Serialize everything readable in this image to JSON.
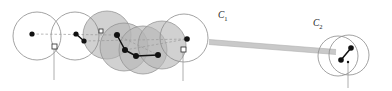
{
  "figure": {
    "background_color": "#ffffff",
    "width": 392,
    "height": 91,
    "labels": [
      {
        "name": "cluster-label-c1",
        "base": "C",
        "subscript": "1",
        "x": 218,
        "y": 18
      },
      {
        "name": "cluster-label-c2",
        "base": "C",
        "subscript": "2",
        "x": 313,
        "y": 26
      }
    ],
    "colors": {
      "circle_stroke": "#8c8c8c",
      "circle_fill_shaded": "#b4b4b4",
      "circle_fill_plain": "#ffffff",
      "point_fill": "#111111",
      "segment_stroke": "#111111",
      "dashed_stroke": "#9a9a9a",
      "bar_fill": "#c9c9c9",
      "bar_stroke": "#b0b0b0",
      "marker_fill": "#ffffff",
      "marker_stroke": "#2b2b2b",
      "tick_stroke": "#9a9a9a",
      "label_fill": "#1a1a1a"
    },
    "circles_plain": [
      {
        "name": "disk-c1-a",
        "cx": 37,
        "cy": 36,
        "r": 24
      },
      {
        "name": "disk-c1-b",
        "cx": 75,
        "cy": 36,
        "r": 24
      },
      {
        "name": "disk-c1-g",
        "cx": 184,
        "cy": 38,
        "r": 24
      }
    ],
    "circles_shaded": [
      {
        "name": "disk-c1-c",
        "cx": 107,
        "cy": 35,
        "r": 24
      },
      {
        "name": "disk-c1-d",
        "cx": 124,
        "cy": 47,
        "r": 24
      },
      {
        "name": "disk-c1-e",
        "cx": 143,
        "cy": 50,
        "r": 24
      },
      {
        "name": "disk-c1-f",
        "cx": 162,
        "cy": 45,
        "r": 24
      }
    ],
    "circles_c2": [
      {
        "name": "disk-c2-a",
        "cx": 349,
        "cy": 55,
        "r": 20
      },
      {
        "name": "disk-c2-b",
        "cx": 338,
        "cy": 56,
        "r": 20
      }
    ],
    "points": [
      {
        "name": "point-p1",
        "cx": 32,
        "cy": 34,
        "r": 2.6
      },
      {
        "name": "point-p2",
        "cx": 76,
        "cy": 34,
        "r": 2.6
      },
      {
        "name": "point-p3",
        "cx": 84,
        "cy": 41,
        "r": 2.6
      },
      {
        "name": "point-p4",
        "cx": 117,
        "cy": 35,
        "r": 3.0
      },
      {
        "name": "point-p5",
        "cx": 125,
        "cy": 50,
        "r": 3.0
      },
      {
        "name": "point-p6",
        "cx": 136,
        "cy": 56,
        "r": 3.0
      },
      {
        "name": "point-p7",
        "cx": 158,
        "cy": 55,
        "r": 3.0
      },
      {
        "name": "point-p8",
        "cx": 187,
        "cy": 39,
        "r": 2.8
      },
      {
        "name": "point-c2a",
        "cx": 351,
        "cy": 48,
        "r": 2.8
      },
      {
        "name": "point-c2b",
        "cx": 341,
        "cy": 60,
        "r": 2.8
      },
      {
        "name": "point-tiny",
        "cx": 348,
        "cy": 62,
        "r": 1.2
      },
      {
        "name": "point-tiny-left",
        "cx": 56,
        "cy": 48,
        "r": 1.2
      }
    ],
    "segments": [
      {
        "name": "segment-s1",
        "x1": 76,
        "y1": 34,
        "x2": 84,
        "y2": 41
      },
      {
        "name": "segment-s2",
        "x1": 117,
        "y1": 35,
        "x2": 125,
        "y2": 50
      },
      {
        "name": "segment-s3",
        "x1": 125,
        "y1": 50,
        "x2": 136,
        "y2": 56
      },
      {
        "name": "segment-s4",
        "x1": 136,
        "y1": 56,
        "x2": 158,
        "y2": 55
      },
      {
        "name": "segment-c2",
        "x1": 351,
        "y1": 48,
        "x2": 341,
        "y2": 60
      }
    ],
    "dashed_paths": [
      {
        "name": "dashed-d1",
        "x1": 32,
        "y1": 34,
        "x2": 117,
        "y2": 35
      },
      {
        "name": "dashed-d2",
        "x1": 84,
        "y1": 41,
        "x2": 187,
        "y2": 39
      },
      {
        "name": "dashed-d3",
        "x1": 117,
        "y1": 35,
        "x2": 158,
        "y2": 55
      },
      {
        "name": "dashed-d4",
        "x1": 125,
        "y1": 50,
        "x2": 187,
        "y2": 39
      }
    ],
    "bar": {
      "name": "connecting-bar",
      "x1": 209,
      "y1": 42,
      "x2": 336,
      "y2": 52,
      "thickness": 5
    },
    "markers": [
      {
        "name": "marker-m1",
        "x": 52,
        "y": 44,
        "size": 5,
        "tick_to": 78
      },
      {
        "name": "marker-m2",
        "x": 99,
        "y": 29,
        "size": 4,
        "tick_to": 0
      },
      {
        "name": "marker-m3",
        "x": 181,
        "y": 47,
        "size": 5,
        "tick_to": 79
      }
    ],
    "ticks": [
      {
        "name": "tick-t1",
        "x": 54,
        "y1": 48,
        "y2": 80
      },
      {
        "name": "tick-t2",
        "x": 183,
        "y1": 52,
        "y2": 81
      },
      {
        "name": "tick-t3",
        "x": 348,
        "y1": 62,
        "y2": 88
      }
    ]
  }
}
